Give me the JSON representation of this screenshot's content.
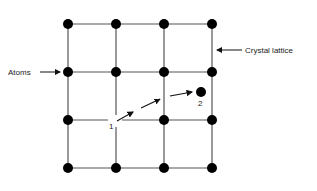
{
  "diagram": {
    "type": "crystal-lattice-interstitial-diffusion",
    "labels": {
      "atoms": "Atoms",
      "crystal_lattice": "Crystal lattice",
      "position_1": "1",
      "position_2": "2"
    },
    "grid": {
      "columns_x": [
        68,
        116,
        164,
        212
      ],
      "rows_y": [
        24,
        72,
        120,
        168
      ]
    },
    "interstitial_atom": {
      "x": 201,
      "y": 92
    },
    "colors": {
      "line": "#555555",
      "atom": "#000000",
      "text": "#222222"
    }
  }
}
